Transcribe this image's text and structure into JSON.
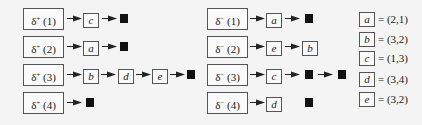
{
  "diagram": {
    "out_lists": [
      {
        "label_symbol": "δ",
        "label_sup": "+",
        "label_arg": "(1)",
        "nodes": [
          "c"
        ]
      },
      {
        "label_symbol": "δ",
        "label_sup": "+",
        "label_arg": "(2)",
        "nodes": [
          "a"
        ]
      },
      {
        "label_symbol": "δ",
        "label_sup": "+",
        "label_arg": "(3)",
        "nodes": [
          "b",
          "d",
          "e"
        ]
      },
      {
        "label_symbol": "δ",
        "label_sup": "+",
        "label_arg": "(4)",
        "nodes": []
      }
    ],
    "in_lists": [
      {
        "label_symbol": "δ",
        "label_sup": "−",
        "label_arg": "(1)",
        "nodes": [
          "a"
        ]
      },
      {
        "label_symbol": "δ",
        "label_sup": "−",
        "label_arg": "(2)",
        "nodes": [
          "e",
          "b"
        ]
      },
      {
        "label_symbol": "δ",
        "label_sup": "−",
        "label_arg": "(3)",
        "nodes": [
          "c"
        ]
      },
      {
        "label_symbol": "δ",
        "label_sup": "−",
        "label_arg": "(4)",
        "nodes": [
          "d"
        ]
      }
    ],
    "legend": [
      {
        "edge": "a",
        "value": "= (2,1)"
      },
      {
        "edge": "b",
        "value": "= (3,2)"
      },
      {
        "edge": "c",
        "value": "= (1,3)"
      },
      {
        "edge": "d",
        "value": "= (3,4)"
      },
      {
        "edge": "e",
        "value": "= (3,2)"
      }
    ],
    "null_marker": "■"
  }
}
